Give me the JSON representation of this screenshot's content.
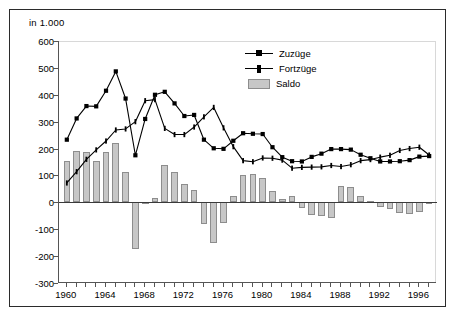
{
  "unit_label": "in 1.000",
  "legend": {
    "position": "inside-top-right",
    "entries": [
      {
        "label": "Zuzüge",
        "marker": "line-square"
      },
      {
        "label": "Fortzüge",
        "marker": "line-tick"
      },
      {
        "label": "Saldo",
        "marker": "bar-swatch"
      }
    ]
  },
  "colors": {
    "line": "#000000",
    "bar_fill": "#c7c7c7",
    "bar_stroke": "#8d8d8d",
    "axis": "#555555",
    "frame": "#2b2b2b",
    "background": "#ffffff"
  },
  "axes": {
    "y_ticks": [
      "600",
      "500",
      "400",
      "300",
      "200",
      "100",
      "0",
      "-100",
      "-200",
      "-300"
    ],
    "x_ticks": [
      "1960",
      "1964",
      "1968",
      "1972",
      "1976",
      "1980",
      "1984",
      "1988",
      "1992",
      "1996"
    ]
  },
  "chart_data": {
    "type": "line",
    "title": "",
    "subtitle": "",
    "xlabel": "",
    "ylabel": "in 1.000",
    "ylim": [
      -300,
      600
    ],
    "xlim": [
      1959.2,
      1997.8
    ],
    "grid": false,
    "legend_position": "inside-top-right",
    "x": [
      1960,
      1961,
      1962,
      1963,
      1964,
      1965,
      1966,
      1967,
      1968,
      1969,
      1970,
      1971,
      1972,
      1973,
      1974,
      1975,
      1976,
      1977,
      1978,
      1979,
      1980,
      1981,
      1982,
      1983,
      1984,
      1985,
      1986,
      1987,
      1988,
      1989,
      1990,
      1991,
      1992,
      1993,
      1994,
      1995,
      1996,
      1997
    ],
    "series": [
      {
        "name": "Zuzüge",
        "marker": "square",
        "values": [
          233,
          312,
          358,
          357,
          415,
          487,
          386,
          175,
          310,
          400,
          411,
          368,
          321,
          325,
          233,
          201,
          199,
          229,
          257,
          255,
          254,
          205,
          168,
          153,
          152,
          169,
          181,
          198,
          198,
          196,
          177,
          164,
          152,
          152,
          153,
          157,
          170,
          172
        ]
      },
      {
        "name": "Fortzüge",
        "marker": "tick",
        "values": [
          72,
          114,
          160,
          195,
          228,
          269,
          273,
          300,
          378,
          382,
          275,
          252,
          252,
          280,
          318,
          353,
          277,
          207,
          155,
          151,
          165,
          164,
          157,
          127,
          130,
          131,
          132,
          137,
          133,
          140,
          155,
          159,
          168,
          175,
          193,
          200,
          205,
          176
        ]
      }
    ],
    "bar_series": {
      "name": "Saldo",
      "values": [
        155,
        190,
        188,
        155,
        187,
        222,
        113,
        -175,
        -6,
        17,
        138,
        114,
        70,
        45,
        -80,
        -150,
        -78,
        22,
        102,
        104,
        89,
        41,
        11,
        25,
        -22,
        -46,
        -50,
        -60,
        61,
        56,
        22,
        5,
        -16,
        -23,
        -40,
        -43,
        -35,
        -4
      ]
    }
  },
  "bar_geometry_note": "Saldo bars are drawn from the zero baseline."
}
